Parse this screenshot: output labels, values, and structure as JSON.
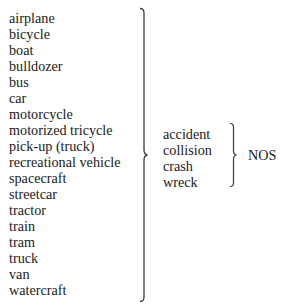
{
  "vehicles": [
    "airplane",
    "bicycle",
    "boat",
    "bulldozer",
    "bus",
    "car",
    "motorcycle",
    "motorized tricycle",
    "pick-up (truck)",
    "recreational vehicle",
    "spacecraft",
    "streetcar",
    "tractor",
    "train",
    "tram",
    "truck",
    "van",
    "watercraft"
  ],
  "events": [
    "accident",
    "collision",
    "crash",
    "wreck"
  ],
  "qualifier": "NOS",
  "icons": {
    "large_brace": "right-curly-brace-icon",
    "small_brace": "right-curly-brace-icon"
  }
}
